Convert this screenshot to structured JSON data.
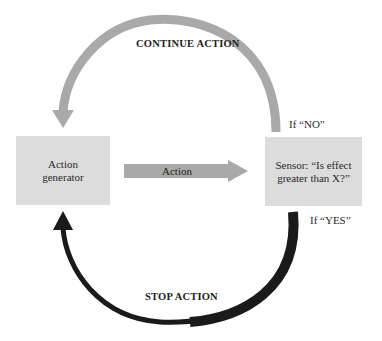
{
  "diagram": {
    "nodes": {
      "action_generator": {
        "line1": "Action",
        "line2": "generator"
      },
      "sensor": {
        "line1": "Sensor: “Is effect",
        "line2": "greater than X?”"
      }
    },
    "edges": {
      "action": {
        "label": "Action"
      },
      "continue": {
        "label": "CONTINUE ACTION",
        "condition": "If “NO”"
      },
      "stop": {
        "label": "STOP ACTION",
        "condition": "If “YES”"
      }
    },
    "colors": {
      "box_fill": "#dcdcdc",
      "continue_arc": "#a9a9a9",
      "action_arrow": "#a9a9a9",
      "stop_arc": "#1a1a1a"
    }
  }
}
